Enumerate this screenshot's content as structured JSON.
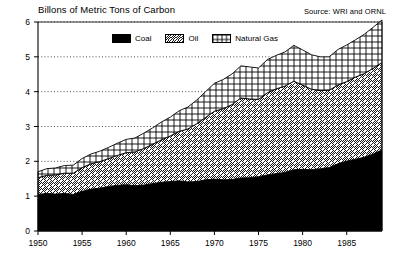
{
  "chart_data": {
    "type": "area",
    "title": "Billons of Metric Tons of Carbon",
    "subtitle": "",
    "source_note": "Source: WRI and ORNL",
    "xlabel": "",
    "ylabel": "Billons of Metric Tons of Carbon",
    "xlim": [
      1950,
      1989
    ],
    "ylim": [
      0,
      6
    ],
    "grid": true,
    "stacked": true,
    "legend_position": "top-center",
    "y_ticks": [
      0,
      1,
      2,
      3,
      4,
      5,
      6
    ],
    "y_tick_labels": [
      "0",
      "1",
      "2",
      "3",
      "4",
      "5",
      "6"
    ],
    "x_ticks": [
      1950,
      1955,
      1960,
      1965,
      1970,
      1975,
      1980,
      1985
    ],
    "x_tick_labels": [
      "1950",
      "1955",
      "1960",
      "1965",
      "1970",
      "1975",
      "1980",
      "1985"
    ],
    "x": [
      1950,
      1951,
      1952,
      1953,
      1954,
      1955,
      1956,
      1957,
      1958,
      1959,
      1960,
      1961,
      1962,
      1963,
      1964,
      1965,
      1966,
      1967,
      1968,
      1969,
      1970,
      1971,
      1972,
      1973,
      1974,
      1975,
      1976,
      1977,
      1978,
      1979,
      1980,
      1981,
      1982,
      1983,
      1984,
      1985,
      1986,
      1987,
      1988,
      1989
    ],
    "series": [
      {
        "name": "Coal",
        "pattern": "solid-black",
        "color": "#000000",
        "values": [
          1.05,
          1.08,
          1.06,
          1.08,
          1.05,
          1.14,
          1.2,
          1.23,
          1.28,
          1.31,
          1.33,
          1.3,
          1.32,
          1.36,
          1.4,
          1.42,
          1.44,
          1.41,
          1.42,
          1.47,
          1.49,
          1.47,
          1.48,
          1.52,
          1.53,
          1.56,
          1.61,
          1.65,
          1.68,
          1.76,
          1.77,
          1.76,
          1.79,
          1.82,
          1.93,
          2.01,
          2.06,
          2.12,
          2.21,
          2.33
        ]
      },
      {
        "name": "Oil",
        "pattern": "diagonal-hatch",
        "color": "#ffffff",
        "values": [
          0.48,
          0.52,
          0.55,
          0.58,
          0.61,
          0.68,
          0.73,
          0.76,
          0.8,
          0.86,
          0.92,
          0.97,
          1.05,
          1.13,
          1.22,
          1.31,
          1.42,
          1.52,
          1.66,
          1.79,
          1.95,
          2.04,
          2.15,
          2.3,
          2.26,
          2.22,
          2.36,
          2.43,
          2.48,
          2.54,
          2.42,
          2.31,
          2.24,
          2.22,
          2.26,
          2.28,
          2.36,
          2.4,
          2.46,
          2.51
        ]
      },
      {
        "name": "Natural Gas",
        "pattern": "crosshatch",
        "color": "#ffffff",
        "values": [
          0.17,
          0.19,
          0.2,
          0.22,
          0.23,
          0.26,
          0.28,
          0.3,
          0.32,
          0.35,
          0.38,
          0.4,
          0.44,
          0.47,
          0.51,
          0.54,
          0.59,
          0.63,
          0.68,
          0.74,
          0.8,
          0.84,
          0.88,
          0.92,
          0.92,
          0.9,
          0.95,
          0.96,
          0.98,
          1.03,
          1.01,
          0.99,
          0.97,
          0.96,
          1.02,
          1.05,
          1.07,
          1.13,
          1.18,
          1.22
        ]
      }
    ],
    "legend": [
      {
        "label": "Coal",
        "pattern": "solid-black"
      },
      {
        "label": "Oil",
        "pattern": "diagonal-hatch"
      },
      {
        "label": "Natural Gas",
        "pattern": "crosshatch"
      }
    ]
  },
  "plot_geometry": {
    "left": 38,
    "right": 382,
    "top": 22,
    "bottom": 231
  }
}
